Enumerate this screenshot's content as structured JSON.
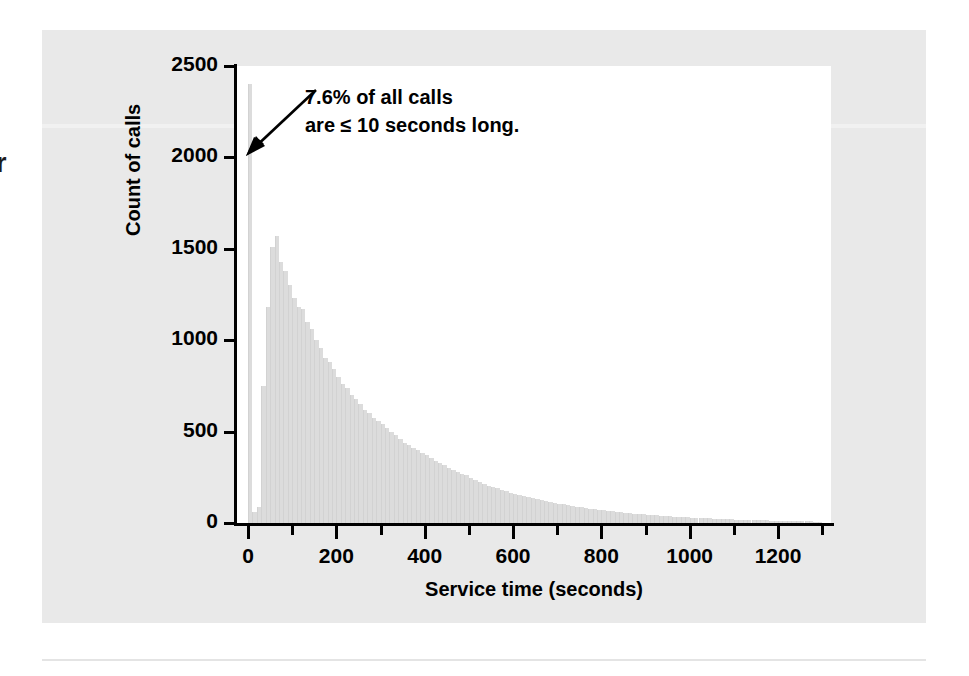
{
  "figure": {
    "margin_glyph": "r",
    "panel_color": "#e9e9e9",
    "plot_background": "#ffffff",
    "bar_color": "#dcdcdc",
    "axis_color": "#000000"
  },
  "annotation": {
    "line1": "7.6% of all calls",
    "line2": "are ≤ 10 seconds long.",
    "arrow": "arrow-pointing-down-left"
  },
  "chart_data": {
    "type": "bar",
    "title": "",
    "subtitle": "",
    "xlabel": "Service time (seconds)",
    "ylabel": "Count of calls",
    "xlim": [
      -25,
      1320
    ],
    "ylim": [
      0,
      2500
    ],
    "grid": false,
    "legend": null,
    "bin_width": 10,
    "x_ticks": [
      0,
      200,
      400,
      600,
      800,
      1000,
      1200
    ],
    "x_tick_labels": [
      "0",
      "200",
      "400",
      "600",
      "800",
      "1000",
      "1200"
    ],
    "x_minor_ticks": [
      100,
      300,
      500,
      700,
      900,
      1100,
      1300
    ],
    "y_ticks": [
      0,
      500,
      1000,
      1500,
      2000,
      2500
    ],
    "y_tick_labels": [
      "0",
      "500",
      "1000",
      "1500",
      "2000",
      "2500"
    ],
    "annotations": [
      {
        "text": "7.6% of all calls are ≤ 10 seconds long.",
        "points_to_x": 5,
        "points_to_y": 2100
      }
    ],
    "x": [
      5,
      15,
      25,
      35,
      45,
      55,
      65,
      75,
      85,
      95,
      105,
      115,
      125,
      135,
      145,
      155,
      165,
      175,
      185,
      195,
      205,
      215,
      225,
      235,
      245,
      255,
      265,
      275,
      285,
      295,
      305,
      315,
      325,
      335,
      345,
      355,
      365,
      375,
      385,
      395,
      405,
      415,
      425,
      435,
      445,
      455,
      465,
      475,
      485,
      495,
      505,
      515,
      525,
      535,
      545,
      555,
      565,
      575,
      585,
      595,
      605,
      615,
      625,
      635,
      645,
      655,
      665,
      675,
      685,
      695,
      705,
      715,
      725,
      735,
      745,
      755,
      765,
      775,
      785,
      795,
      805,
      815,
      825,
      835,
      845,
      855,
      865,
      875,
      885,
      895,
      905,
      915,
      925,
      935,
      945,
      955,
      965,
      975,
      985,
      995,
      1005,
      1015,
      1025,
      1035,
      1045,
      1055,
      1065,
      1075,
      1085,
      1095,
      1105,
      1115,
      1125,
      1135,
      1145,
      1155,
      1165,
      1175,
      1185,
      1195,
      1205,
      1215,
      1225,
      1235,
      1245,
      1255,
      1265,
      1275,
      1285,
      1295
    ],
    "values": [
      2400,
      60,
      90,
      750,
      1180,
      1510,
      1570,
      1430,
      1380,
      1300,
      1230,
      1180,
      1170,
      1100,
      1060,
      1000,
      960,
      900,
      880,
      840,
      800,
      760,
      740,
      700,
      680,
      650,
      620,
      600,
      575,
      560,
      540,
      520,
      500,
      480,
      460,
      440,
      425,
      410,
      400,
      385,
      370,
      355,
      340,
      330,
      315,
      300,
      290,
      280,
      270,
      260,
      245,
      235,
      225,
      215,
      205,
      195,
      190,
      180,
      175,
      165,
      160,
      155,
      148,
      142,
      136,
      130,
      126,
      120,
      115,
      110,
      106,
      102,
      98,
      94,
      90,
      86,
      82,
      79,
      76,
      73,
      70,
      67,
      64,
      62,
      59,
      57,
      54,
      52,
      50,
      48,
      46,
      44,
      42,
      40,
      39,
      37,
      35,
      34,
      32,
      31,
      30,
      28,
      27,
      26,
      25,
      24,
      23,
      22,
      21,
      20,
      19,
      18,
      17,
      17,
      16,
      15,
      15,
      14,
      13,
      13,
      12,
      12,
      11,
      11,
      10,
      10,
      9,
      9,
      8,
      8
    ]
  }
}
